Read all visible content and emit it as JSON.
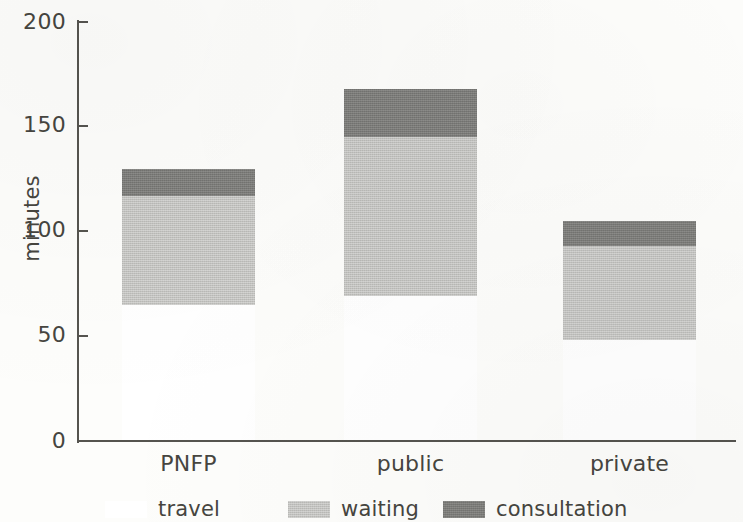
{
  "chart_data": {
    "type": "bar",
    "subtype": "stacked",
    "title": "",
    "xlabel": "",
    "ylabel": "minutes",
    "categories": [
      "PNFP",
      "public",
      "private"
    ],
    "series": [
      {
        "name": "travel",
        "color": "#ffffff",
        "values": [
          65,
          69,
          48
        ]
      },
      {
        "name": "waiting",
        "color": "#c3c3c0",
        "values": [
          52,
          76,
          45
        ]
      },
      {
        "name": "consultation",
        "color": "#7c7c79",
        "values": [
          13,
          23,
          12
        ]
      }
    ],
    "stack_totals": [
      130,
      168,
      105
    ],
    "cumulative_tops": [
      {
        "category": "PNFP",
        "travel": 65,
        "travel_plus_waiting": 117,
        "total": 130
      },
      {
        "category": "public",
        "travel": 69,
        "travel_plus_waiting": 145,
        "total": 168
      },
      {
        "category": "private",
        "travel": 48,
        "travel_plus_waiting": 93,
        "total": 105
      }
    ],
    "ylim": [
      0,
      200
    ],
    "yticks": [
      0,
      50,
      100,
      150,
      200
    ],
    "ytick_labels": [
      "0",
      "50",
      "100",
      "150",
      "200"
    ],
    "grid": false,
    "legend_position": "bottom",
    "legend": [
      "travel",
      "waiting",
      "consultation"
    ]
  },
  "axis": {
    "y_title": "minutes"
  },
  "legend": {
    "entries": [
      {
        "label": "travel",
        "swatch": "travel-swatch"
      },
      {
        "label": "waiting",
        "swatch": "waiting-swatch"
      },
      {
        "label": "consultation",
        "swatch": "consultation-swatch"
      }
    ]
  }
}
